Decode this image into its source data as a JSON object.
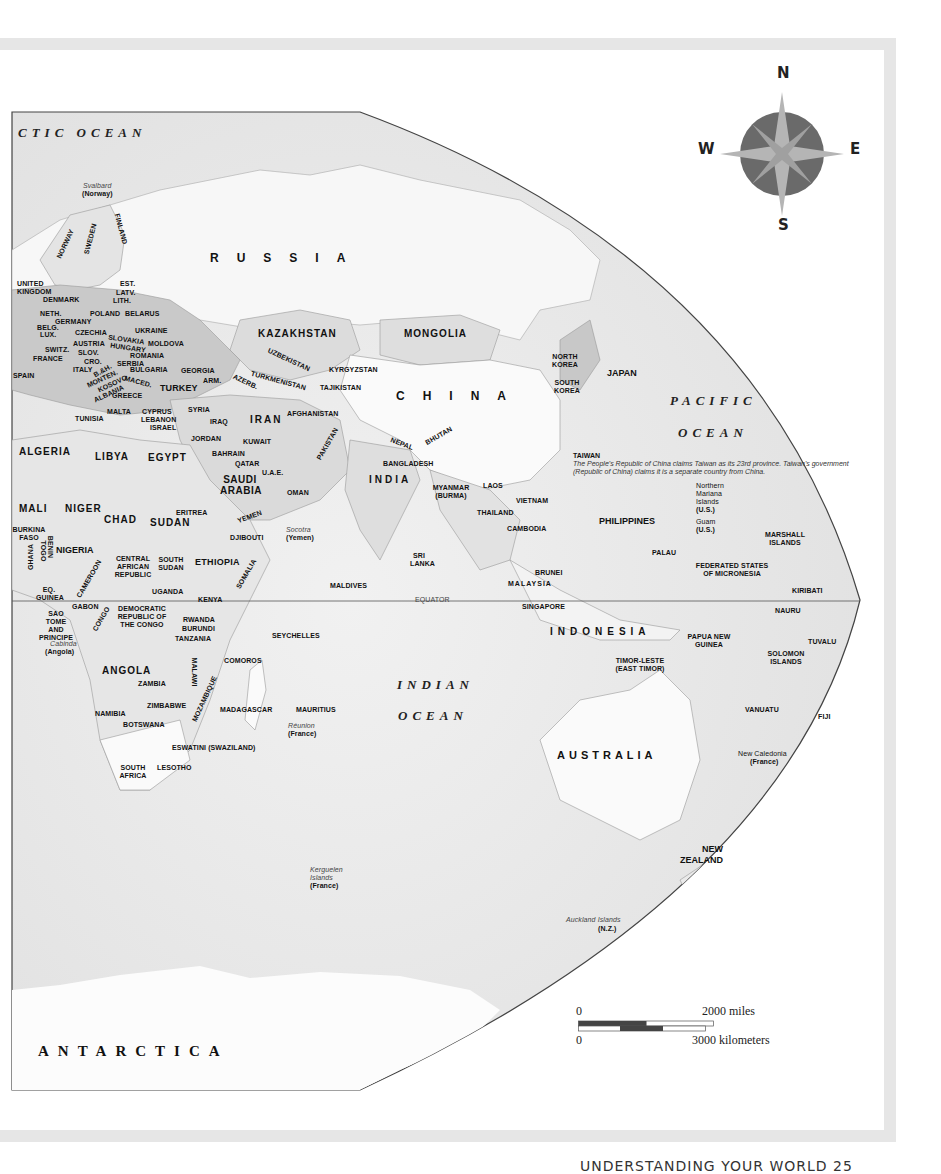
{
  "map": {
    "oceans": {
      "arctic": "CTIC OCEAN",
      "pacific_1": "PACIFIC",
      "pacific_2": "OCEAN",
      "indian_1": "INDIAN",
      "indian_2": "OCEAN"
    },
    "equator_label": "EQUATOR",
    "continents": {
      "antarctica": "ANTARCTICA",
      "australia": "AUSTRALIA"
    },
    "large_countries": {
      "russia": "RUSSIA",
      "china": "CHINA",
      "indonesia": "INDONESIA",
      "india": "INDIA"
    },
    "territories": {
      "svalbard": "Svalbard",
      "svalbard_owner": "(Norway)",
      "socotra": "Socotra",
      "socotra_owner": "(Yemen)",
      "cabinda": "Cabinda",
      "cabinda_owner": "(Angola)",
      "reunion": "Réunion",
      "reunion_owner": "(France)",
      "kerguelen": "Kerguelen Islands",
      "kerguelen_owner": "(France)",
      "auckland": "Auckland Islands",
      "auckland_owner": "(N.Z.)",
      "new_caledonia": "New Caledonia",
      "new_caledonia_owner": "(France)",
      "northern_mariana": "Northern Mariana Islands",
      "northern_mariana_owner": "(U.S.)",
      "guam": "Guam",
      "guam_owner": "(U.S.)"
    },
    "taiwan_note": {
      "title": "TAIWAN",
      "text": "The People's Republic of China claims Taiwan as its 23rd province. Taiwan's government (Republic of China) claims it is a separate country from China."
    },
    "countries": [
      {
        "id": "norway",
        "label": "NORWAY"
      },
      {
        "id": "sweden",
        "label": "SWEDEN"
      },
      {
        "id": "finland",
        "label": "FINLAND"
      },
      {
        "id": "uk",
        "label": "UNITED KINGDOM"
      },
      {
        "id": "denmark",
        "label": "DENMARK"
      },
      {
        "id": "est",
        "label": "EST."
      },
      {
        "id": "latv",
        "label": "LATV."
      },
      {
        "id": "lith",
        "label": "LITH."
      },
      {
        "id": "neth",
        "label": "NETH."
      },
      {
        "id": "poland",
        "label": "POLAND"
      },
      {
        "id": "belarus",
        "label": "BELARUS"
      },
      {
        "id": "germany",
        "label": "GERMANY"
      },
      {
        "id": "belg",
        "label": "BELG."
      },
      {
        "id": "lux",
        "label": "LUX."
      },
      {
        "id": "czechia",
        "label": "CZECHIA"
      },
      {
        "id": "ukraine",
        "label": "UKRAINE"
      },
      {
        "id": "slovakia",
        "label": "SLOVAKIA"
      },
      {
        "id": "austria",
        "label": "AUSTRIA"
      },
      {
        "id": "hungary",
        "label": "HUNGARY"
      },
      {
        "id": "moldova",
        "label": "MOLDOVA"
      },
      {
        "id": "switz",
        "label": "SWITZ."
      },
      {
        "id": "slov",
        "label": "SLOV."
      },
      {
        "id": "france",
        "label": "FRANCE"
      },
      {
        "id": "cro",
        "label": "CRO."
      },
      {
        "id": "romania",
        "label": "ROMANIA"
      },
      {
        "id": "serbia",
        "label": "SERBIA"
      },
      {
        "id": "italy",
        "label": "ITALY"
      },
      {
        "id": "bh",
        "label": "B.&H."
      },
      {
        "id": "spain",
        "label": "SPAIN"
      },
      {
        "id": "bulgaria",
        "label": "BULGARIA"
      },
      {
        "id": "monten",
        "label": "MONTEN."
      },
      {
        "id": "kosovo",
        "label": "KOSOVO"
      },
      {
        "id": "maced",
        "label": "MACED."
      },
      {
        "id": "albania",
        "label": "ALBANIA"
      },
      {
        "id": "greece",
        "label": "GREECE"
      },
      {
        "id": "georgia",
        "label": "GEORGIA"
      },
      {
        "id": "arm",
        "label": "ARM."
      },
      {
        "id": "azerb",
        "label": "AZERB."
      },
      {
        "id": "turkey",
        "label": "TURKEY"
      },
      {
        "id": "kazakhstan",
        "label": "KAZAKHSTAN"
      },
      {
        "id": "mongolia",
        "label": "MONGOLIA"
      },
      {
        "id": "uzbekistan",
        "label": "UZBEKISTAN"
      },
      {
        "id": "turkmenistan",
        "label": "TURKMENISTAN"
      },
      {
        "id": "kyrgyzstan",
        "label": "KYRGYZSTAN"
      },
      {
        "id": "tajikistan",
        "label": "TAJIKISTAN"
      },
      {
        "id": "malta",
        "label": "MALTA"
      },
      {
        "id": "tunisia",
        "label": "TUNISIA"
      },
      {
        "id": "cyprus",
        "label": "CYPRUS"
      },
      {
        "id": "lebanon",
        "label": "LEBANON"
      },
      {
        "id": "israel",
        "label": "ISRAEL"
      },
      {
        "id": "syria",
        "label": "SYRIA"
      },
      {
        "id": "iraq",
        "label": "IRAQ"
      },
      {
        "id": "iran",
        "label": "IRAN"
      },
      {
        "id": "afghanistan",
        "label": "AFGHANISTAN"
      },
      {
        "id": "jordan",
        "label": "JORDAN"
      },
      {
        "id": "kuwait",
        "label": "KUWAIT"
      },
      {
        "id": "pakistan",
        "label": "PAKISTAN"
      },
      {
        "id": "nepal",
        "label": "NEPAL"
      },
      {
        "id": "bhutan",
        "label": "BHUTAN"
      },
      {
        "id": "algeria",
        "label": "ALGERIA"
      },
      {
        "id": "libya",
        "label": "LIBYA"
      },
      {
        "id": "egypt",
        "label": "EGYPT"
      },
      {
        "id": "bahrain",
        "label": "BAHRAIN"
      },
      {
        "id": "qatar",
        "label": "QATAR"
      },
      {
        "id": "uae",
        "label": "U.A.E."
      },
      {
        "id": "saudi",
        "label": "SAUDI ARABIA"
      },
      {
        "id": "oman",
        "label": "OMAN"
      },
      {
        "id": "bangladesh",
        "label": "BANGLADESH"
      },
      {
        "id": "myanmar",
        "label": "MYANMAR (BURMA)"
      },
      {
        "id": "laos",
        "label": "LAOS"
      },
      {
        "id": "vietnam",
        "label": "VIETNAM"
      },
      {
        "id": "thailand",
        "label": "THAILAND"
      },
      {
        "id": "cambodia",
        "label": "CAMBODIA"
      },
      {
        "id": "north_korea",
        "label": "NORTH KOREA"
      },
      {
        "id": "south_korea",
        "label": "SOUTH KOREA"
      },
      {
        "id": "japan",
        "label": "JAPAN"
      },
      {
        "id": "philippines",
        "label": "PHILIPPINES"
      },
      {
        "id": "mali",
        "label": "MALI"
      },
      {
        "id": "niger",
        "label": "NIGER"
      },
      {
        "id": "chad",
        "label": "CHAD"
      },
      {
        "id": "sudan",
        "label": "SUDAN"
      },
      {
        "id": "eritrea",
        "label": "ERITREA"
      },
      {
        "id": "yemen",
        "label": "YEMEN"
      },
      {
        "id": "djibouti",
        "label": "DJIBOUTI"
      },
      {
        "id": "burkina",
        "label": "BURKINA FASO"
      },
      {
        "id": "nigeria",
        "label": "NIGERIA"
      },
      {
        "id": "ghana",
        "label": "GHANA"
      },
      {
        "id": "togo",
        "label": "TOGO"
      },
      {
        "id": "benin",
        "label": "BENIN"
      },
      {
        "id": "car",
        "label": "CENTRAL AFRICAN REPUBLIC"
      },
      {
        "id": "south_sudan",
        "label": "SOUTH SUDAN"
      },
      {
        "id": "ethiopia",
        "label": "ETHIOPIA"
      },
      {
        "id": "somalia",
        "label": "SOMALIA"
      },
      {
        "id": "cameroon",
        "label": "CAMEROON"
      },
      {
        "id": "eq_guinea",
        "label": "EQ. GUINEA"
      },
      {
        "id": "gabon",
        "label": "GABON"
      },
      {
        "id": "congo",
        "label": "CONGO"
      },
      {
        "id": "uganda",
        "label": "UGANDA"
      },
      {
        "id": "kenya",
        "label": "KENYA"
      },
      {
        "id": "sao_tome",
        "label": "SAO TOME AND PRINCIPE"
      },
      {
        "id": "drc",
        "label": "DEMOCRATIC REPUBLIC OF THE CONGO"
      },
      {
        "id": "rwanda",
        "label": "RWANDA"
      },
      {
        "id": "burundi",
        "label": "BURUNDI"
      },
      {
        "id": "tanzania",
        "label": "TANZANIA"
      },
      {
        "id": "angola",
        "label": "ANGOLA"
      },
      {
        "id": "comoros",
        "label": "COMOROS"
      },
      {
        "id": "zambia",
        "label": "ZAMBIA"
      },
      {
        "id": "malawi",
        "label": "MALAWI"
      },
      {
        "id": "mozambique",
        "label": "MOZAMBIQUE"
      },
      {
        "id": "zimbabwe",
        "label": "ZIMBABWE"
      },
      {
        "id": "namibia",
        "label": "NAMIBIA"
      },
      {
        "id": "botswana",
        "label": "BOTSWANA"
      },
      {
        "id": "madagascar",
        "label": "MADAGASCAR"
      },
      {
        "id": "mauritius",
        "label": "MAURITIUS"
      },
      {
        "id": "eswatini",
        "label": "ESWATINI (SWAZILAND)"
      },
      {
        "id": "south_africa",
        "label": "SOUTH AFRICA"
      },
      {
        "id": "lesotho",
        "label": "LESOTHO"
      },
      {
        "id": "sri_lanka",
        "label": "SRI LANKA"
      },
      {
        "id": "maldives",
        "label": "MALDIVES"
      },
      {
        "id": "seychelles",
        "label": "SEYCHELLES"
      },
      {
        "id": "brunei",
        "label": "BRUNEI"
      },
      {
        "id": "malaysia",
        "label": "MALAYSIA"
      },
      {
        "id": "singapore",
        "label": "SINGAPORE"
      },
      {
        "id": "palau",
        "label": "PALAU"
      },
      {
        "id": "micronesia",
        "label": "FEDERATED STATES OF MICRONESIA"
      },
      {
        "id": "marshall",
        "label": "MARSHALL ISLANDS"
      },
      {
        "id": "kiribati",
        "label": "KIRIBATI"
      },
      {
        "id": "nauru",
        "label": "NAURU"
      },
      {
        "id": "png",
        "label": "PAPUA NEW GUINEA"
      },
      {
        "id": "timor",
        "label": "TIMOR-LESTE (EAST TIMOR)"
      },
      {
        "id": "solomon",
        "label": "SOLOMON ISLANDS"
      },
      {
        "id": "tuvalu",
        "label": "TUVALU"
      },
      {
        "id": "vanuatu",
        "label": "VANUATU"
      },
      {
        "id": "fiji",
        "label": "FIJI"
      },
      {
        "id": "new_zealand",
        "label": "NEW ZEALAND"
      }
    ]
  },
  "compass": {
    "n": "N",
    "e": "E",
    "s": "S",
    "w": "W"
  },
  "scale": {
    "miles_zero": "0",
    "miles_label": "2000 miles",
    "km_zero": "0",
    "km_label": "3000 kilometers"
  },
  "footer": {
    "text": "UNDERSTANDING YOUR WORLD   25"
  },
  "colors": {
    "ocean": "#e9e9e9",
    "land": "#f7f7f7",
    "shaded_land": "#c9c9c9",
    "dark_land": "#9a9a9a",
    "frame": "#e6e6e6",
    "compass_ring": "#6a6a6a",
    "compass_star": "#b5b5b5"
  }
}
